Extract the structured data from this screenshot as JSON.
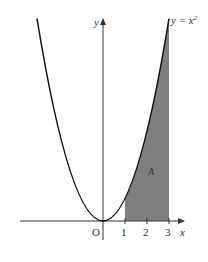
{
  "diagram": {
    "curve_label": "y = x²",
    "curve_label_base": "y = x",
    "curve_label_exp": "2",
    "y_axis_label": "y",
    "x_axis_label": "x",
    "origin_label": "O",
    "region_label": "A",
    "ticks": [
      "1",
      "2",
      "3"
    ],
    "shaded_region": {
      "from_x": 1,
      "to_x": 3,
      "color": "#808080"
    },
    "curve_color": "#111111"
  }
}
